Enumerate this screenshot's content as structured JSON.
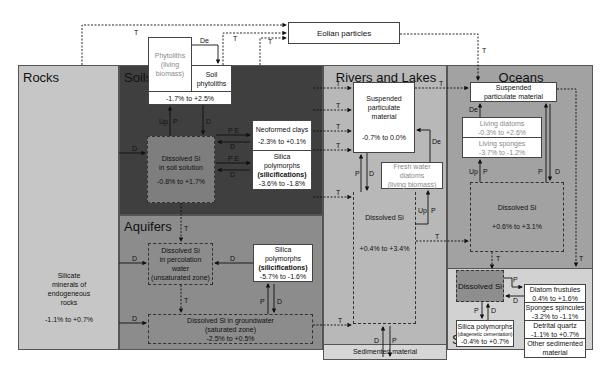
{
  "regions": {
    "rocks": {
      "title": "Rocks",
      "body": [
        "Silicate",
        "minerals of",
        "endogeneous",
        "rocks"
      ],
      "range": "-1.1% to +0.7%",
      "color": "#c6c6c6"
    },
    "soils": {
      "title": "Soils",
      "color": "#3f3f3f"
    },
    "aquifers": {
      "title": "Aquifers",
      "color": "#8c8c8c"
    },
    "rivers": {
      "title": "Rivers and Lakes",
      "color": "#b8b8b8"
    },
    "oceans": {
      "title": "Oceans",
      "color": "#a2a2a2"
    },
    "sediments": {
      "title": "Sediments",
      "color": "#d2d2d2"
    }
  },
  "external": {
    "eolian": "Eolian particles"
  },
  "soils": {
    "phytoliths_living": [
      "Phytoliths",
      "(living",
      "biomass)"
    ],
    "soil_phytoliths": [
      "Soil",
      "phytoliths"
    ],
    "phyto_range": "-1.7% to +2.5%",
    "dissolved": [
      "Dissolved Si",
      "in soil solution"
    ],
    "dissolved_range": "-0.8% to +1.7%",
    "neoformed": "Neoformed clays",
    "neoformed_range": "-2.3% to +0.1%",
    "silica_poly": [
      "Silica",
      "polymorphs"
    ],
    "silica_poly_bold": "(silicifications)",
    "silica_range": "-3.6% to -1.8%"
  },
  "aquifers": {
    "percolation": [
      "Dissolved Si",
      "in percolation",
      "water",
      "(unsaturated zone)"
    ],
    "silica_poly": [
      "Silica",
      "polymorphs"
    ],
    "silica_poly_bold": "(silicifications)",
    "silica_range": "-5.7% to -1.6%",
    "groundwater": [
      "Dissolved Si in groundwater",
      "(saturated zone)"
    ],
    "groundwater_range": "-2.5% to +0.5%"
  },
  "rivers": {
    "suspended": [
      "Suspended",
      "particulate",
      "material"
    ],
    "suspended_range": "-0.7% to 0.0%",
    "diatoms": [
      "Fresh water",
      "diatoms",
      "(living biomass)"
    ],
    "dissolved": "Dissolved Si",
    "dissolved_range": "+0.4% to +3.4%",
    "sedimented": "Sedimented material"
  },
  "oceans": {
    "suspended": [
      "Suspended",
      "particulate material"
    ],
    "living_diatoms": "Living diatoms",
    "living_diatoms_range": "-0.3% to +2.6%",
    "living_sponges": "Living sponges",
    "living_sponges_range": "-3.7% to -1.2%",
    "dissolved": "Dissolved Si",
    "dissolved_range": "+0.6% to +3.1%"
  },
  "sediments": {
    "dissolved": "Dissolved Si",
    "silica_poly": "Silica polymorphs",
    "silica_poly_sub": "(diagenetic cementation)",
    "silica_range": "-0.4% to +0.7%",
    "frustules": "Diatom frustules",
    "frustules_range": "0.4% to +1.6%",
    "spicules": "Sponges spincules",
    "spicules_range": "-3.2% to -1.1%",
    "quartz": "Detrital quartz",
    "quartz_range": "-1.1% to +0.7%",
    "other": [
      "Other sedimented",
      "material"
    ]
  },
  "flow_labels": {
    "T": "T",
    "D": "D",
    "P": "P",
    "De": "De",
    "Up": "Up",
    "PE": "P E"
  }
}
